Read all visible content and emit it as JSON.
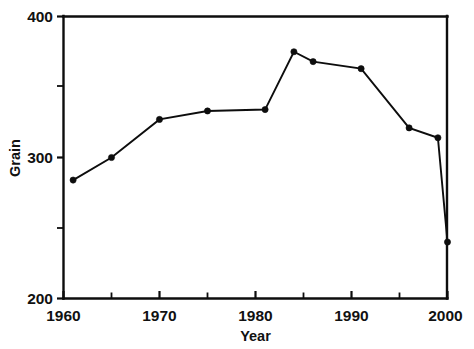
{
  "chart_data": {
    "type": "line",
    "title": "",
    "subtitle": "",
    "xlabel": "Year",
    "ylabel": "Grain",
    "xlim": [
      1960,
      2000
    ],
    "ylim": [
      200,
      400
    ],
    "grid": false,
    "legend": null,
    "x_ticks_major": [
      1960,
      1970,
      1980,
      1990,
      2000
    ],
    "x_tick_labels": [
      "1960",
      "1970",
      "1980",
      "1990",
      "2000"
    ],
    "x_ticks_minor": [
      1965,
      1975,
      1985,
      1995
    ],
    "y_ticks_major": [
      200,
      300,
      400
    ],
    "y_tick_labels": [
      "200",
      "300",
      "400"
    ],
    "y_ticks_minor": [
      250,
      350
    ],
    "marker": "filled-circle",
    "line_color": "#0d0d0d",
    "marker_color": "#0d0d0d",
    "background_color": "#ffffff",
    "series": [
      {
        "name": "Grain",
        "x": [
          1961,
          1965,
          1970,
          1975,
          1981,
          1984,
          1986,
          1991,
          1996,
          1999,
          2000
        ],
        "values": [
          284,
          300,
          327,
          333,
          334,
          375,
          368,
          363,
          321,
          314,
          240
        ]
      }
    ],
    "points": [
      {
        "x": 1961,
        "y": 284
      },
      {
        "x": 1965,
        "y": 300
      },
      {
        "x": 1970,
        "y": 327
      },
      {
        "x": 1975,
        "y": 333
      },
      {
        "x": 1981,
        "y": 334
      },
      {
        "x": 1984,
        "y": 375
      },
      {
        "x": 1986,
        "y": 368
      },
      {
        "x": 1991,
        "y": 363
      },
      {
        "x": 1996,
        "y": 321
      },
      {
        "x": 1999,
        "y": 314
      },
      {
        "x": 2000,
        "y": 240
      }
    ]
  }
}
